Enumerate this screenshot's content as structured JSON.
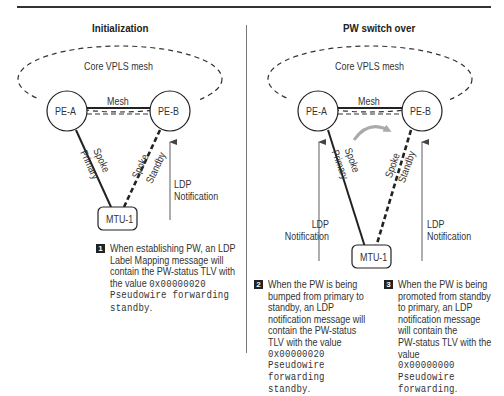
{
  "panels": [
    {
      "title": "Initialization",
      "core_label": "Core VPLS mesh",
      "nodes": {
        "pe_a": "PE-A",
        "pe_b": "PE-B",
        "mtu": "MTU-1"
      },
      "mesh_label": "Mesh",
      "spoke_primary": {
        "line1": "Spoke",
        "line2": "Primary"
      },
      "spoke_standby": {
        "line1": "Spoke",
        "line2": "Standby"
      },
      "ldp_right": {
        "line1": "LDP",
        "line2": "Notification"
      }
    },
    {
      "title": "PW switch over",
      "core_label": "Core VPLS mesh",
      "nodes": {
        "pe_a": "PE-A",
        "pe_b": "PE-B",
        "mtu": "MTU-1"
      },
      "mesh_label": "Mesh",
      "spoke_primary": {
        "line1": "Spoke",
        "line2": "Primary"
      },
      "spoke_standby": {
        "line1": "Spoke",
        "line2": "Standby"
      },
      "ldp_left": {
        "line1": "LDP",
        "line2": "Notification"
      },
      "ldp_right": {
        "line1": "LDP",
        "line2": "Notification"
      }
    }
  ],
  "notes": [
    {
      "number": "1",
      "lines": [
        "When establishing PW, an LDP",
        "Label Mapping message will",
        "contain the PW-status TLV with"
      ],
      "last_text": "the value ",
      "mono": [
        "0x00000020",
        "Pseudowire forwarding",
        "standby"
      ],
      "suffix": "."
    },
    {
      "number": "2",
      "lines": [
        "When the PW is being",
        "bumped from primary to",
        "standby, an LDP",
        "notification message will",
        "contain the PW-status",
        "TLV with the value"
      ],
      "mono": [
        "0x00000020",
        "Pseudowire",
        "forwarding",
        "standby"
      ],
      "suffix": "."
    },
    {
      "number": "3",
      "lines": [
        "When the PW is being",
        "promoted from standby",
        "to primary, an LDP",
        "notification message",
        "will contain the",
        "PW-status TLV with the",
        "value"
      ],
      "mono": [
        "0x00000000",
        "Pseudowire",
        "forwarding"
      ],
      "suffix": "."
    }
  ],
  "colors": {
    "line": "#222222",
    "arrow_gray": "#777777",
    "curve_arrow": "#aaaaaa"
  }
}
